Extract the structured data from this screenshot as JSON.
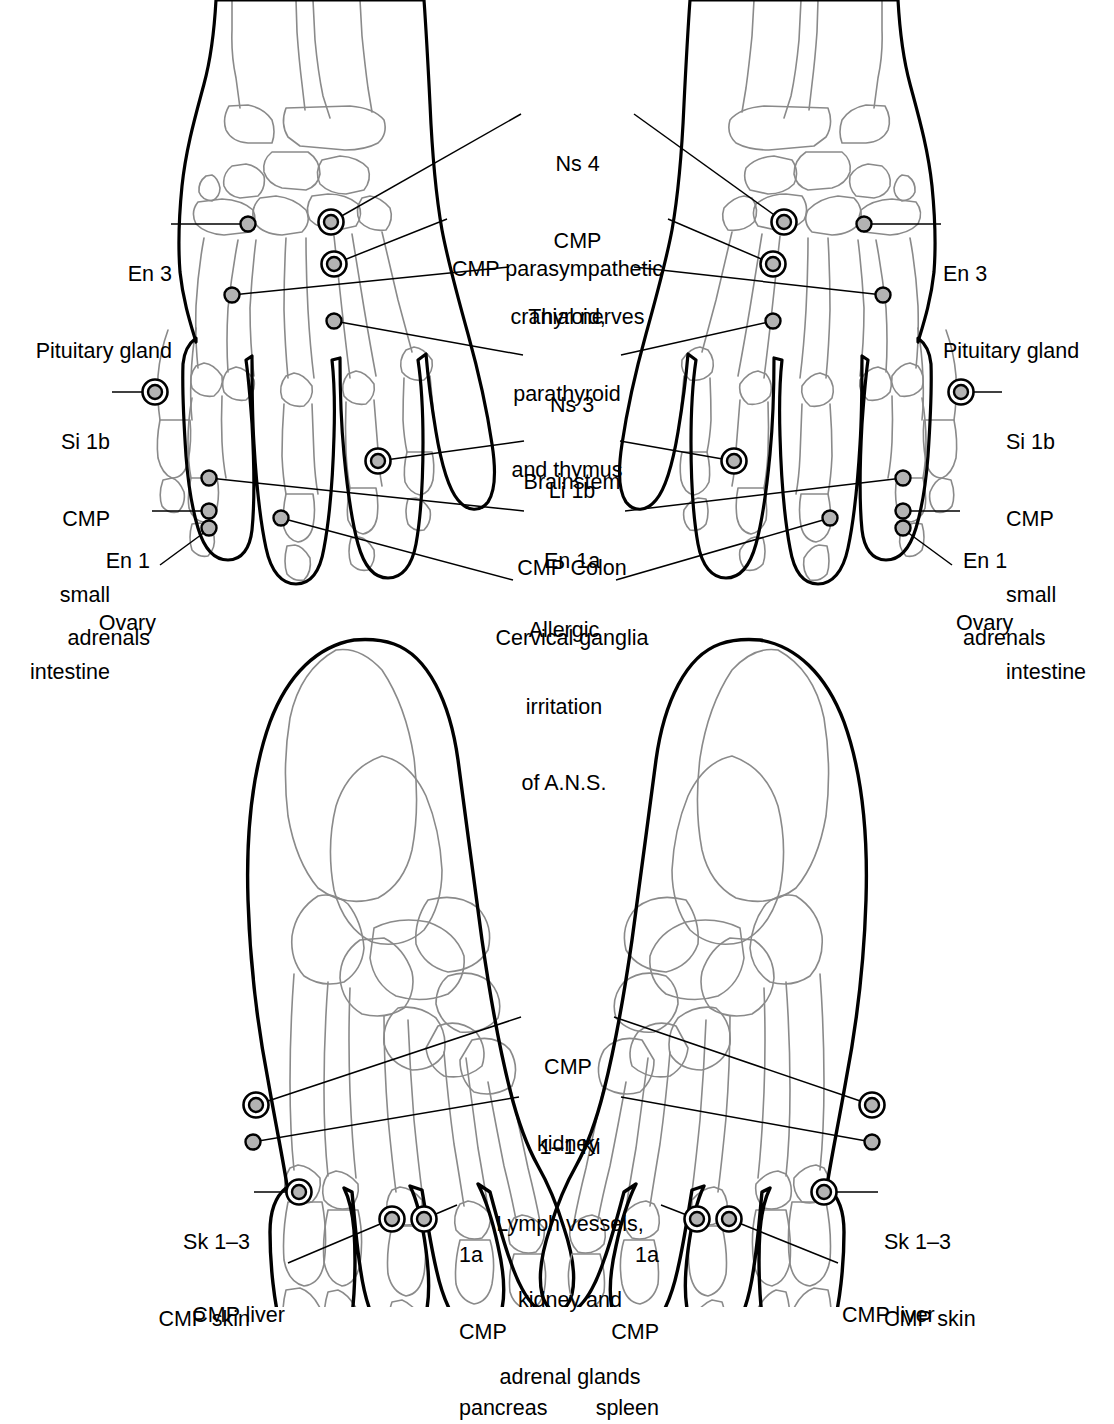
{
  "figure": {
    "type": "anatomical-diagram",
    "ink_color": "#000000",
    "bone_outline_color": "#8a8a8a",
    "marker_fill_color": "#b3b3b3",
    "background": "#ffffff"
  },
  "hand_panel": {
    "name": "hands-dorsal-view",
    "labels": {
      "en3_left": {
        "line1": "En 3",
        "line2": "Pituitary gland"
      },
      "en3_right": {
        "line1": "En 3",
        "line2": "Pituitary gland"
      },
      "ns4": {
        "line1": "Ns 4",
        "line2": "CMP",
        "line3": "cranial nerves"
      },
      "parasympathetic": {
        "line1": "CMP parasympathetic"
      },
      "thyroid": {
        "line1": "Thyroid,",
        "line2": "parathyroid",
        "line3": "and thymus"
      },
      "ns3": {
        "line1": "Ns 3",
        "line2": "Brainstem"
      },
      "si1b_left": {
        "line1": "Si 1b",
        "line2": "CMP",
        "line3": "small",
        "line4": "intestine"
      },
      "si1b_right": {
        "line1": "Si 1b",
        "line2": "CMP",
        "line3": "small",
        "line4": "intestine"
      },
      "li1b": {
        "line1": "Li 1b",
        "line2": "CMP Colon"
      },
      "en1a": {
        "line1": "En 1a",
        "line2": "Cervical ganglia"
      },
      "en1_left": {
        "line1": "En 1",
        "line2": "adrenals"
      },
      "en1_right": {
        "line1": "En 1",
        "line2": "adrenals"
      },
      "ovary_left": {
        "line1": "Ovary"
      },
      "ovary_right": {
        "line1": "Ovary"
      },
      "allergic": {
        "line1": "Allergic",
        "line2": "irritation",
        "line3": "of A.N.S."
      }
    }
  },
  "foot_panel": {
    "name": "feet-dorsal-view",
    "labels": {
      "cmp_kidney": {
        "line1": "CMP",
        "line2": "kidney"
      },
      "ki_1_1": {
        "line1": "1–1 Ki",
        "line2": "Lymph vessels,",
        "line3": "kidney and",
        "line4": "adrenal glands"
      },
      "sk13_left": {
        "line1": "Sk 1–3",
        "line2": "CMP skin"
      },
      "sk13_right": {
        "line1": "Sk 1–3",
        "line2": "CMP skin"
      },
      "cmp_liver_left": {
        "line1": "CMP liver"
      },
      "cmp_liver_right": {
        "line1": "CMP liver"
      },
      "pancreas": {
        "line1": "1a",
        "line2": "CMP",
        "line3": "pancreas"
      },
      "spleen": {
        "line1": "1a",
        "line2": "CMP",
        "line3": "spleen"
      }
    }
  },
  "markers": {
    "hand_left": [
      {
        "name": "en3",
        "x": 248,
        "y": 224,
        "ring": false
      },
      {
        "name": "ns4",
        "x": 331,
        "y": 222,
        "ring": true
      },
      {
        "name": "parasympathetic",
        "x": 334,
        "y": 264,
        "ring": true
      },
      {
        "name": "thyroid",
        "x": 232,
        "y": 295,
        "ring": false
      },
      {
        "name": "ns3",
        "x": 334,
        "y": 321,
        "ring": false
      },
      {
        "name": "si1b",
        "x": 155,
        "y": 392,
        "ring": true
      },
      {
        "name": "li1b",
        "x": 378,
        "y": 461,
        "ring": true
      },
      {
        "name": "en1a",
        "x": 209,
        "y": 478,
        "ring": false
      },
      {
        "name": "en1",
        "x": 209,
        "y": 511,
        "ring": false
      },
      {
        "name": "ovary",
        "x": 209,
        "y": 528,
        "ring": false
      },
      {
        "name": "allergic",
        "x": 281,
        "y": 518,
        "ring": false
      }
    ],
    "hand_right": [
      {
        "name": "en3",
        "x": 864,
        "y": 224,
        "ring": false
      },
      {
        "name": "ns4",
        "x": 784,
        "y": 222,
        "ring": true
      },
      {
        "name": "parasympathetic",
        "x": 773,
        "y": 264,
        "ring": true
      },
      {
        "name": "thyroid",
        "x": 883,
        "y": 295,
        "ring": false
      },
      {
        "name": "ns3",
        "x": 773,
        "y": 321,
        "ring": false
      },
      {
        "name": "si1b",
        "x": 961,
        "y": 392,
        "ring": true
      },
      {
        "name": "li1b",
        "x": 734,
        "y": 461,
        "ring": true
      },
      {
        "name": "en1a",
        "x": 903,
        "y": 478,
        "ring": false
      },
      {
        "name": "en1",
        "x": 903,
        "y": 511,
        "ring": false
      },
      {
        "name": "ovary",
        "x": 903,
        "y": 528,
        "ring": false
      },
      {
        "name": "allergic",
        "x": 830,
        "y": 518,
        "ring": false
      }
    ],
    "foot_left": [
      {
        "name": "cmp-kidney",
        "x": 256,
        "y": 1105,
        "ring": true
      },
      {
        "name": "ki-1-1",
        "x": 253,
        "y": 1142,
        "ring": false
      },
      {
        "name": "sk1-3",
        "x": 299,
        "y": 1192,
        "ring": true
      },
      {
        "name": "cmp-liver",
        "x": 392,
        "y": 1219,
        "ring": true
      },
      {
        "name": "pancreas",
        "x": 424,
        "y": 1219,
        "ring": true
      }
    ],
    "foot_right": [
      {
        "name": "cmp-kidney",
        "x": 872,
        "y": 1105,
        "ring": true
      },
      {
        "name": "ki-1-1",
        "x": 872,
        "y": 1142,
        "ring": false
      },
      {
        "name": "sk1-3",
        "x": 824,
        "y": 1192,
        "ring": true
      },
      {
        "name": "cmp-liver",
        "x": 729,
        "y": 1219,
        "ring": true
      },
      {
        "name": "spleen",
        "x": 697,
        "y": 1219,
        "ring": true
      }
    ]
  }
}
